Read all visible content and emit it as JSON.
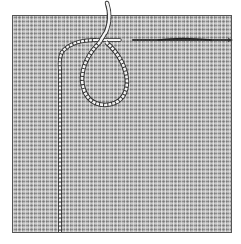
{
  "figure": {
    "colors": {
      "background": "#ffffff",
      "canvas": "#b8b8b8",
      "canvas_border": "#555555",
      "cord_fill": "#f4f4f4",
      "cord_outline": "#333333",
      "needle": "#444444"
    }
  }
}
